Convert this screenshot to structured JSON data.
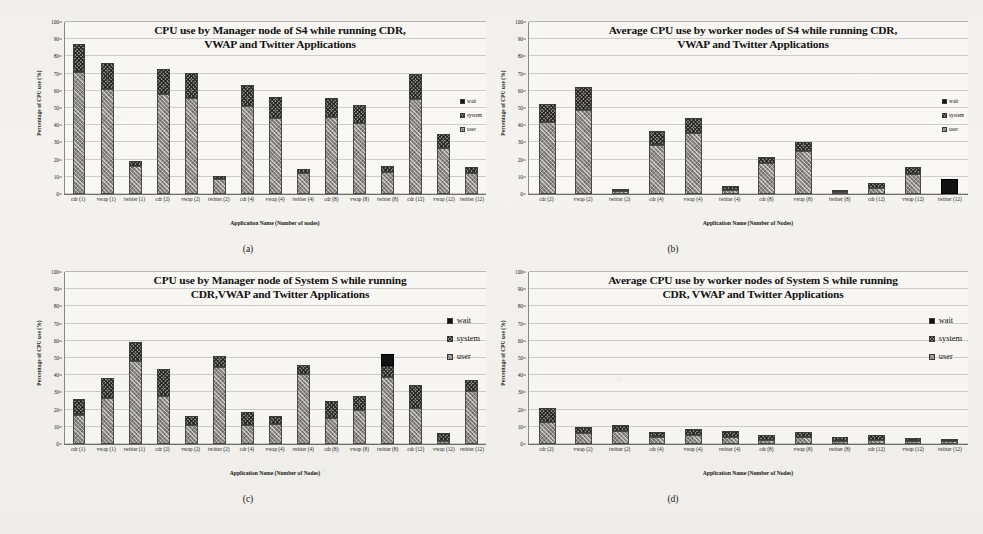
{
  "figure": {
    "panels": [
      "a",
      "b",
      "c",
      "d"
    ],
    "captions": {
      "a": "(a)",
      "b": "(b)",
      "c": "(c)",
      "d": "(d)"
    }
  },
  "chart_data": [
    {
      "panel": "a",
      "type": "bar",
      "stacked": true,
      "title": "CPU use by Manager node of S4 while running CDR, VWAP and Twitter Applications",
      "title_line1": "CPU use by Manager node of S4 while running CDR,",
      "title_line2": "VWAP and Twitter Applications",
      "xlabel": "Application Name (Number of nodes)",
      "ylabel": "Percentage of CPU use (%)",
      "ylim": [
        0,
        100
      ],
      "yticks": [
        0,
        10,
        20,
        30,
        40,
        50,
        60,
        70,
        80,
        90,
        100
      ],
      "grid": true,
      "legend": [
        "wait",
        "system",
        "user"
      ],
      "legend_position": "right-inside",
      "categories": [
        "cdr (1)",
        "vwap (1)",
        "twitter (1)",
        "cdr (2)",
        "vwap (2)",
        "twitter (2)",
        "cdr (4)",
        "vwap (4)",
        "twitter (4)",
        "cdr (8)",
        "vwap (8)",
        "twitter (8)",
        "cdr (12)",
        "vwap (12)",
        "twitter (12)"
      ],
      "series": [
        {
          "name": "user",
          "values": [
            71,
            61,
            16,
            58,
            56,
            8.5,
            51,
            44,
            12,
            45,
            41,
            13,
            55,
            27,
            12
          ]
        },
        {
          "name": "system",
          "values": [
            16,
            15,
            3,
            14.5,
            14.5,
            2,
            12.5,
            12.5,
            2.5,
            11,
            11,
            3.5,
            15,
            8,
            4
          ]
        },
        {
          "name": "wait",
          "values": [
            0,
            0,
            0,
            0,
            0,
            0,
            0,
            0,
            0,
            0,
            0,
            0,
            0,
            0,
            0
          ]
        }
      ],
      "totals": [
        87,
        76,
        19,
        72.5,
        70.5,
        10.5,
        63.5,
        56.5,
        14.5,
        56,
        52,
        16.5,
        70,
        35,
        16
      ]
    },
    {
      "panel": "b",
      "type": "bar",
      "stacked": true,
      "title": "Average CPU use by worker nodes of S4 while running CDR, VWAP and Twitter Applications",
      "title_line1": "Average CPU use by worker nodes of S4 while running CDR,",
      "title_line2": "VWAP and Twitter Applications",
      "xlabel": "Application Name (Number of Nodes)",
      "ylabel": "Percentage of CPU use (%)",
      "ylim": [
        0,
        100
      ],
      "yticks": [
        0,
        10,
        20,
        30,
        40,
        50,
        60,
        70,
        80,
        90,
        100
      ],
      "grid": true,
      "legend": [
        "wait",
        "system",
        "user"
      ],
      "legend_position": "right-inside",
      "categories": [
        "cdr (2)",
        "vwap (2)",
        "twitter (2)",
        "cdr (4)",
        "vwap (4)",
        "twitter (4)",
        "cdr (8)",
        "vwap (8)",
        "twitter (8)",
        "cdr (12)",
        "vwap (12)",
        "twitter (12)"
      ],
      "series": [
        {
          "name": "user",
          "values": [
            42,
            49,
            1.5,
            28.5,
            35.5,
            2.5,
            18,
            25,
            1.2,
            3.5,
            11.5,
            0
          ]
        },
        {
          "name": "system",
          "values": [
            10.5,
            13.5,
            1.2,
            8,
            8.5,
            2,
            3.5,
            5.5,
            1.3,
            3,
            4,
            0
          ]
        },
        {
          "name": "wait",
          "values": [
            0,
            0,
            0,
            0,
            0,
            0,
            0,
            0,
            0,
            0,
            0,
            8.5
          ]
        }
      ],
      "totals": [
        52.5,
        62.5,
        2.7,
        36.5,
        44,
        4.5,
        21.5,
        30.5,
        2.5,
        6.5,
        15.5,
        8.5
      ]
    },
    {
      "panel": "c",
      "type": "bar",
      "stacked": true,
      "title": "CPU use by Manager node of System S while running CDR,VWAP and Twitter Applications",
      "title_line1": "CPU use by Manager node of System S while running",
      "title_line2": "CDR,VWAP and Twitter Applications",
      "xlabel": "Application Name (Number of Nodes)",
      "ylabel": "Percentage of CPU use (%)",
      "ylim": [
        0,
        100
      ],
      "yticks": [
        0,
        10,
        20,
        30,
        40,
        50,
        60,
        70,
        80,
        90,
        100
      ],
      "grid": true,
      "legend": [
        "wait",
        "system",
        "user"
      ],
      "legend_position": "right-inside",
      "categories": [
        "cdr (1)",
        "vwap (1)",
        "twitter (1)",
        "cdr (2)",
        "vwap (2)",
        "twitter (2)",
        "cdr (4)",
        "vwap (4)",
        "twitter (4)",
        "cdr (8)",
        "vwap (8)",
        "twitter (8)",
        "cdr (12)",
        "vwap (12)",
        "twitter (12)"
      ],
      "series": [
        {
          "name": "user",
          "values": [
            17,
            27,
            48.5,
            28,
            11,
            44.5,
            11,
            11.5,
            40.5,
            15,
            19.5,
            39,
            21,
            1.5,
            31
          ]
        },
        {
          "name": "system",
          "values": [
            9,
            11.5,
            11,
            15.5,
            5.5,
            6.5,
            7.5,
            5,
            5.5,
            10,
            8.5,
            6.5,
            13.5,
            5,
            6
          ]
        },
        {
          "name": "wait",
          "values": [
            0,
            0,
            0,
            0,
            0,
            0,
            0,
            0,
            0,
            0,
            0,
            7,
            0,
            0,
            0
          ]
        }
      ],
      "totals": [
        26,
        38.5,
        59.5,
        43.5,
        16.5,
        51,
        18.5,
        16.5,
        46,
        25,
        28,
        52.5,
        34.5,
        6.5,
        37
      ]
    },
    {
      "panel": "d",
      "type": "bar",
      "stacked": true,
      "title": "Average CPU use by worker nodes of System S while running CDR, VWAP and Twitter Applications",
      "title_line1": "Average CPU use by worker nodes of System S while running",
      "title_line2": "CDR, VWAP and Twitter Applications",
      "xlabel": "Application Name (Number of Nodes)",
      "ylabel": "Percentage of CPU use (%)",
      "ylim": [
        0,
        100
      ],
      "yticks": [
        0,
        10,
        20,
        30,
        40,
        50,
        60,
        70,
        80,
        90,
        100
      ],
      "grid": true,
      "legend": [
        "wait",
        "system",
        "user"
      ],
      "legend_position": "right-inside",
      "categories": [
        "cdr (2)",
        "vwap (2)",
        "twitter (2)",
        "cdr (4)",
        "vwap (4)",
        "twitter (4)",
        "cdr (8)",
        "vwap (8)",
        "twitter (8)",
        "cdr (12)",
        "vwap (12)",
        "twitter (12)"
      ],
      "series": [
        {
          "name": "user",
          "values": [
            13,
            6.5,
            7.5,
            4,
            5,
            4,
            2.5,
            4,
            2,
            2.5,
            1.5,
            1.5
          ]
        },
        {
          "name": "system",
          "values": [
            8,
            3.5,
            3.5,
            3,
            4,
            3.5,
            2.5,
            3,
            2,
            3,
            2,
            1.5
          ]
        },
        {
          "name": "wait",
          "values": [
            0,
            0,
            0,
            0,
            0,
            0,
            0,
            0,
            0,
            0,
            0,
            0
          ]
        }
      ],
      "totals": [
        21,
        10,
        11,
        7,
        9,
        7.5,
        5,
        7,
        4,
        5.5,
        3.5,
        3
      ]
    }
  ]
}
